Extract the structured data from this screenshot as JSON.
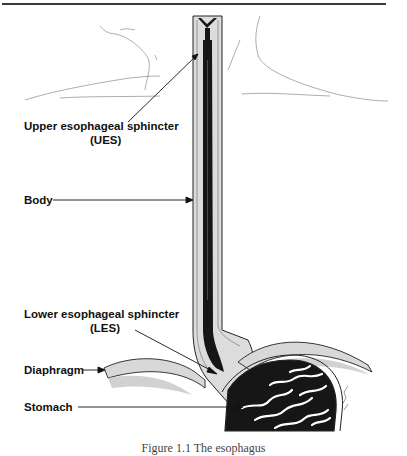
{
  "figure": {
    "caption": "Figure 1.1 The esophagus",
    "labels": {
      "ues_line1": "Upper esophageal sphincter",
      "ues_line2": "(UES)",
      "body": "Body",
      "les_line1": "Lower esophageal sphincter",
      "les_line2": "(LES)",
      "diaphragm": "Diaphragm",
      "stomach": "Stomach"
    },
    "colors": {
      "ink": "#111111",
      "lumen": "#161616",
      "wall": "#d9d9d9",
      "sketch": "#8a8a8a",
      "rule": "#3a3a3a"
    }
  }
}
